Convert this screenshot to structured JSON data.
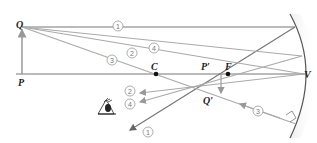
{
  "diagram": {
    "type": "concave-mirror-ray-diagram",
    "labels": {
      "object_top": "Q",
      "object_base": "P",
      "center": "C",
      "focus": "F",
      "image_base": "P′",
      "image_top": "Q′",
      "vertex": "V"
    },
    "ray_numbers": [
      "1",
      "2",
      "3",
      "4"
    ],
    "colors": {
      "ray": "#a8a8a8",
      "axis": "#777777",
      "mirror": "#555555",
      "text": "#222222",
      "point": "#111111"
    }
  }
}
